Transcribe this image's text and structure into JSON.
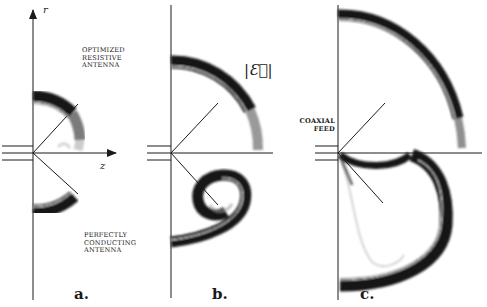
{
  "figure": {
    "panels": [
      {
        "id": "a",
        "tag": "a."
      },
      {
        "id": "b",
        "tag": "b."
      },
      {
        "id": "c",
        "tag": "c."
      }
    ],
    "axis_labels": {
      "r": "r",
      "z": "z"
    },
    "annotations": {
      "optimized": [
        "OPTIMIZED",
        "RESISTIVE",
        "ANTENNA"
      ],
      "perfect": [
        "PERFECTLY",
        "CONDUCTING",
        "ANTENNA"
      ],
      "field": "|Ɛ⃗|",
      "coaxial": [
        "COAXIAL",
        "FEED"
      ]
    },
    "colors": {
      "ink": "#1a1a1a",
      "ring": "#161616",
      "faint": "#9a9a9a"
    }
  }
}
